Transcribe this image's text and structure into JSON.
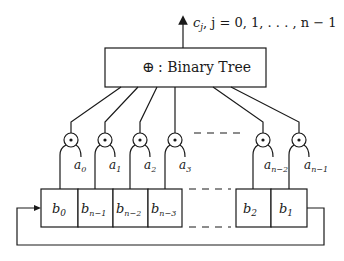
{
  "diagram": {
    "output": {
      "var": "c",
      "sub": "j",
      "range": ",  j = 0, 1, . . . , n − 1"
    },
    "tree_box": {
      "symbol": "⊕",
      "label": ": Binary Tree"
    },
    "multipliers": [
      {
        "a_label": "a",
        "a_sub": "0"
      },
      {
        "a_label": "a",
        "a_sub": "1"
      },
      {
        "a_label": "a",
        "a_sub": "2"
      },
      {
        "a_label": "a",
        "a_sub": "3"
      },
      {
        "a_label": "a",
        "a_sub": "n−2"
      },
      {
        "a_label": "a",
        "a_sub": "n−1"
      }
    ],
    "multiplier_symbol": "⊙",
    "registers": [
      {
        "label": "b",
        "sub": "0"
      },
      {
        "label": "b",
        "sub": "n−1"
      },
      {
        "label": "b",
        "sub": "n−2"
      },
      {
        "label": "b",
        "sub": "n−3"
      },
      {
        "label": "b",
        "sub": "2"
      },
      {
        "label": "b",
        "sub": "1"
      }
    ],
    "colors": {
      "line": "#1a1a1a",
      "background": "#ffffff"
    }
  }
}
